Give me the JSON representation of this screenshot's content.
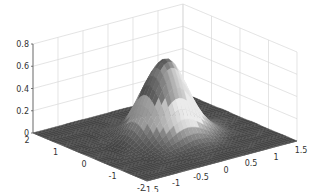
{
  "chart_data": {
    "type": "surface",
    "title": "",
    "xlabel": "",
    "ylabel": "",
    "zlabel": "",
    "function": "gaussian peak centered at origin",
    "x_ticks": [
      -1.5,
      -1,
      -0.5,
      0,
      0.5,
      1,
      1.5
    ],
    "x_tick_labels": [
      "-1.5",
      "-1",
      "-0.5",
      "0",
      "0.5",
      "1",
      "1.5"
    ],
    "y_ticks": [
      -2,
      -1,
      0,
      1,
      2
    ],
    "y_tick_labels": [
      "-2",
      "-1",
      "0",
      "1",
      "2"
    ],
    "z_ticks": [
      0,
      0.2,
      0.4,
      0.6,
      0.8
    ],
    "z_tick_labels": [
      "0",
      "0.2",
      "0.4",
      "0.6",
      "0.8"
    ],
    "xlim": [
      -1.5,
      1.5
    ],
    "ylim": [
      -2,
      2
    ],
    "zlim": [
      0,
      0.8
    ],
    "peak": {
      "x": 0,
      "y": 0,
      "z": 0.7
    },
    "colormap": "grayscale",
    "grid": true,
    "legend": null
  },
  "colors": {
    "grid": "#d8d8d8",
    "axis": "#555555",
    "surface_low": "#4a4a4a",
    "surface_high": "#e0e0e0",
    "peak_top": "#555555"
  }
}
